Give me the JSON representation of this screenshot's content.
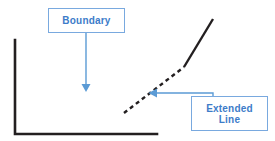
{
  "diagram": {
    "background_color": "#ffffff",
    "callout_color": "#3d7cc9",
    "callout_border_color": "#79a9df",
    "shape_color": "#231f20",
    "labels": {
      "boundary": "Boundary",
      "extended_line": "Extended\nLine"
    },
    "shapes": {
      "triangle": {
        "name": "right-triangle",
        "points": "15,40 15,134 157,134",
        "stroke": "#231f20",
        "stroke_width": 2.6,
        "vertices": [
          {
            "label": "top-left",
            "x": 15,
            "y": 40
          },
          {
            "label": "bottom-left",
            "x": 15,
            "y": 134
          },
          {
            "label": "bottom-right",
            "x": 157,
            "y": 134
          }
        ]
      },
      "extended_dashed": {
        "name": "extended-line-dashed-segment",
        "x1": 124,
        "y1": 113,
        "x2": 184,
        "y2": 67,
        "stroke": "#231f20",
        "stroke_width": 2.4,
        "dash": "4 3.5"
      },
      "extended_solid": {
        "name": "extended-line-solid-segment",
        "x1": 184,
        "y1": 67,
        "x2": 213,
        "y2": 19,
        "stroke": "#231f20",
        "stroke_width": 2.4
      }
    },
    "connectors": {
      "boundary": {
        "name": "boundary-leader-line",
        "path": "M86,33 L86,86",
        "arrow_tip": {
          "x": 86,
          "y": 91
        },
        "stroke": "#5b9bd5",
        "stroke_width": 1.4,
        "direction": "down"
      },
      "extended_line": {
        "name": "extended-line-leader-line",
        "path": "M213,96 L213,93 L156,93",
        "arrow_tip": {
          "x": 149,
          "y": 93
        },
        "stroke": "#5b9bd5",
        "stroke_width": 1.4,
        "direction": "left"
      }
    }
  }
}
